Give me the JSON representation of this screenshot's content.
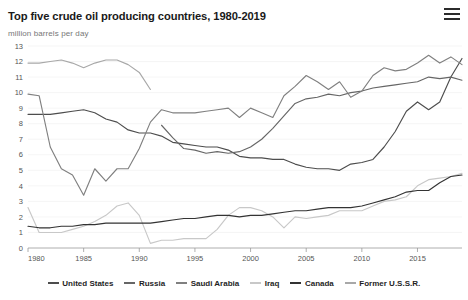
{
  "header": {
    "title": "Top five crude oil producing countries, 1980-2019",
    "menu_icon": "hamburger-menu-icon"
  },
  "subtitle": "million barrels per day",
  "legend": {
    "position": "bottom",
    "items": [
      {
        "label": "United States",
        "color": "#4d4d4d"
      },
      {
        "label": "Russia",
        "color": "#666666"
      },
      {
        "label": "Saudi Arabia",
        "color": "#808080"
      },
      {
        "label": "Iraq",
        "color": "#c8c8c8"
      },
      {
        "label": "Canada",
        "color": "#333333"
      },
      {
        "label": "Former U.S.S.R.",
        "color": "#a8a8a8"
      }
    ]
  },
  "chart_data": {
    "type": "line",
    "title": "Top five crude oil producing countries, 1980-2019",
    "xlabel": "",
    "ylabel": "million barrels per day",
    "xlim": [
      1980,
      2019
    ],
    "ylim": [
      0,
      13
    ],
    "yticks": [
      0,
      1,
      2,
      3,
      4,
      5,
      6,
      7,
      8,
      9,
      10,
      11,
      12,
      13
    ],
    "xticks": [
      1980,
      1985,
      1990,
      1995,
      2000,
      2005,
      2010,
      2015
    ],
    "grid": true,
    "series": [
      {
        "name": "United States",
        "color": "#4d4d4d",
        "x": [
          1980,
          1981,
          1982,
          1983,
          1984,
          1985,
          1986,
          1987,
          1988,
          1989,
          1990,
          1991,
          1992,
          1993,
          1994,
          1995,
          1996,
          1997,
          1998,
          1999,
          2000,
          2001,
          2002,
          2003,
          2004,
          2005,
          2006,
          2007,
          2008,
          2009,
          2010,
          2011,
          2012,
          2013,
          2014,
          2015,
          2016,
          2017,
          2018,
          2019
        ],
        "values": [
          8.6,
          8.6,
          8.6,
          8.7,
          8.8,
          8.9,
          8.7,
          8.3,
          8.1,
          7.6,
          7.4,
          7.4,
          7.2,
          6.8,
          6.7,
          6.6,
          6.5,
          6.5,
          6.3,
          5.9,
          5.8,
          5.8,
          5.7,
          5.7,
          5.4,
          5.2,
          5.1,
          5.1,
          5.0,
          5.4,
          5.5,
          5.7,
          6.5,
          7.5,
          8.8,
          9.4,
          8.9,
          9.4,
          11.0,
          12.2
        ]
      },
      {
        "name": "Russia",
        "color": "#666666",
        "x": [
          1992,
          1993,
          1994,
          1995,
          1996,
          1997,
          1998,
          1999,
          2000,
          2001,
          2002,
          2003,
          2004,
          2005,
          2006,
          2007,
          2008,
          2009,
          2010,
          2011,
          2012,
          2013,
          2014,
          2015,
          2016,
          2017,
          2018,
          2019
        ],
        "values": [
          7.9,
          7.1,
          6.4,
          6.3,
          6.1,
          6.2,
          6.1,
          6.2,
          6.5,
          7.0,
          7.7,
          8.5,
          9.3,
          9.6,
          9.7,
          9.9,
          9.8,
          10.0,
          10.1,
          10.3,
          10.4,
          10.5,
          10.6,
          10.7,
          11.0,
          10.9,
          11.0,
          10.8
        ]
      },
      {
        "name": "Saudi Arabia",
        "color": "#808080",
        "x": [
          1980,
          1981,
          1982,
          1983,
          1984,
          1985,
          1986,
          1987,
          1988,
          1989,
          1990,
          1991,
          1992,
          1993,
          1994,
          1995,
          1996,
          1997,
          1998,
          1999,
          2000,
          2001,
          2002,
          2003,
          2004,
          2005,
          2006,
          2007,
          2008,
          2009,
          2010,
          2011,
          2012,
          2013,
          2014,
          2015,
          2016,
          2017,
          2018,
          2019
        ],
        "values": [
          9.9,
          9.8,
          6.5,
          5.1,
          4.7,
          3.4,
          5.1,
          4.3,
          5.1,
          5.1,
          6.4,
          8.1,
          8.9,
          8.7,
          8.7,
          8.7,
          8.8,
          8.9,
          9.0,
          8.4,
          9.0,
          8.7,
          8.4,
          9.8,
          10.4,
          11.1,
          10.7,
          10.2,
          10.7,
          9.7,
          10.1,
          11.1,
          11.6,
          11.4,
          11.5,
          11.9,
          12.4,
          11.9,
          12.3,
          11.8
        ]
      },
      {
        "name": "Iraq",
        "color": "#c8c8c8",
        "x": [
          1980,
          1981,
          1982,
          1983,
          1984,
          1985,
          1986,
          1987,
          1988,
          1989,
          1990,
          1991,
          1992,
          1993,
          1994,
          1995,
          1996,
          1997,
          1998,
          1999,
          2000,
          2001,
          2002,
          2003,
          2004,
          2005,
          2006,
          2007,
          2008,
          2009,
          2010,
          2011,
          2012,
          2013,
          2014,
          2015,
          2016,
          2017,
          2018,
          2019
        ],
        "values": [
          2.6,
          1.0,
          1.0,
          1.0,
          1.2,
          1.4,
          1.7,
          2.1,
          2.7,
          2.9,
          2.1,
          0.3,
          0.5,
          0.5,
          0.6,
          0.6,
          0.6,
          1.2,
          2.1,
          2.6,
          2.6,
          2.4,
          2.0,
          1.3,
          2.0,
          1.9,
          2.0,
          2.1,
          2.4,
          2.4,
          2.4,
          2.7,
          3.0,
          3.1,
          3.3,
          4.0,
          4.4,
          4.5,
          4.6,
          4.8
        ]
      },
      {
        "name": "Canada",
        "color": "#333333",
        "x": [
          1980,
          1981,
          1982,
          1983,
          1984,
          1985,
          1986,
          1987,
          1988,
          1989,
          1990,
          1991,
          1992,
          1993,
          1994,
          1995,
          1996,
          1997,
          1998,
          1999,
          2000,
          2001,
          2002,
          2003,
          2004,
          2005,
          2006,
          2007,
          2008,
          2009,
          2010,
          2011,
          2012,
          2013,
          2014,
          2015,
          2016,
          2017,
          2018,
          2019
        ],
        "values": [
          1.4,
          1.3,
          1.3,
          1.4,
          1.4,
          1.5,
          1.5,
          1.6,
          1.6,
          1.6,
          1.6,
          1.6,
          1.7,
          1.8,
          1.9,
          1.9,
          2.0,
          2.1,
          2.1,
          2.0,
          2.1,
          2.1,
          2.2,
          2.3,
          2.4,
          2.4,
          2.5,
          2.6,
          2.6,
          2.6,
          2.7,
          2.9,
          3.1,
          3.3,
          3.6,
          3.7,
          3.7,
          4.2,
          4.6,
          4.7
        ]
      },
      {
        "name": "Former U.S.S.R.",
        "color": "#a8a8a8",
        "x": [
          1980,
          1981,
          1982,
          1983,
          1984,
          1985,
          1986,
          1987,
          1988,
          1989,
          1990,
          1991
        ],
        "values": [
          11.9,
          11.9,
          12.0,
          12.1,
          11.9,
          11.6,
          11.9,
          12.1,
          12.1,
          11.8,
          11.3,
          10.2
        ]
      }
    ]
  }
}
